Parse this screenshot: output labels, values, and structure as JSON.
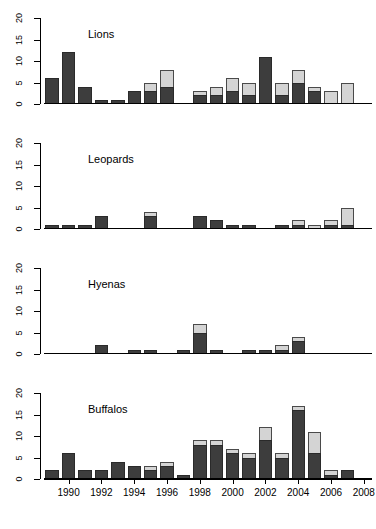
{
  "chart_data": {
    "type": "bar",
    "title": "",
    "stacked": true,
    "panels": [
      {
        "name": "Lions",
        "ylim": [
          0,
          20
        ],
        "yticks": [
          0,
          5,
          10,
          15,
          20
        ],
        "series": [
          {
            "name": "dark",
            "values": [
              6,
              12,
              4,
              1,
              1,
              3,
              3,
              4,
              0,
              2,
              2,
              3,
              2,
              11,
              2,
              5,
              3,
              0,
              0,
              0
            ]
          },
          {
            "name": "light",
            "values": [
              0,
              0,
              0,
              0,
              0,
              0,
              2,
              4,
              0,
              1,
              2,
              3,
              3,
              0,
              3,
              3,
              1,
              3,
              5,
              0
            ]
          }
        ],
        "totals": [
          6,
          12,
          4,
          1,
          1,
          3,
          5,
          8,
          0,
          3,
          4,
          6,
          5,
          11,
          5,
          8,
          4,
          3,
          5,
          0
        ]
      },
      {
        "name": "Leopards",
        "ylim": [
          0,
          20
        ],
        "yticks": [
          0,
          5,
          10,
          15,
          20
        ],
        "series": [
          {
            "name": "dark",
            "values": [
              1,
              1,
              1,
              3,
              0,
              0,
              3,
              0,
              0,
              3,
              2,
              1,
              1,
              0,
              1,
              1,
              0,
              1,
              1,
              0
            ]
          },
          {
            "name": "light",
            "values": [
              0,
              0,
              0,
              0,
              0,
              0,
              1,
              0,
              0,
              0,
              0,
              0,
              0,
              0,
              0,
              1,
              1,
              1,
              4,
              0
            ]
          }
        ],
        "totals": [
          1,
          1,
          1,
          3,
          0,
          0,
          4,
          0,
          0,
          3,
          2,
          1,
          1,
          0,
          1,
          2,
          1,
          2,
          5,
          0
        ]
      },
      {
        "name": "Hyenas",
        "ylim": [
          0,
          20
        ],
        "yticks": [
          0,
          5,
          10,
          15,
          20
        ],
        "series": [
          {
            "name": "dark",
            "values": [
              0,
              0,
              0,
              2,
              0,
              1,
              1,
              0,
              1,
              5,
              1,
              0,
              1,
              1,
              1,
              3,
              0,
              0,
              0,
              0
            ]
          },
          {
            "name": "light",
            "values": [
              0,
              0,
              0,
              0,
              0,
              0,
              0,
              0,
              0,
              2,
              0,
              0,
              0,
              0,
              1,
              1,
              0,
              0,
              0,
              0
            ]
          }
        ],
        "totals": [
          0,
          0,
          0,
          2,
          0,
          1,
          1,
          0,
          1,
          7,
          1,
          0,
          1,
          1,
          2,
          4,
          0,
          0,
          0,
          0
        ]
      },
      {
        "name": "Buffalos",
        "ylim": [
          0,
          20
        ],
        "yticks": [
          0,
          5,
          10,
          15,
          20
        ],
        "series": [
          {
            "name": "dark",
            "values": [
              2,
              6,
              2,
              2,
              4,
              3,
              2,
              3,
              1,
              8,
              8,
              6,
              5,
              9,
              5,
              16,
              6,
              1,
              2,
              0
            ]
          },
          {
            "name": "light",
            "values": [
              0,
              0,
              0,
              0,
              0,
              0,
              1,
              1,
              0,
              1,
              1,
              1,
              1,
              3,
              1,
              1,
              5,
              1,
              0,
              0
            ]
          }
        ],
        "totals": [
          2,
          6,
          2,
          2,
          4,
          3,
          3,
          4,
          1,
          9,
          9,
          7,
          6,
          12,
          6,
          17,
          11,
          2,
          2,
          0
        ]
      }
    ],
    "x": [
      1989,
      1990,
      1991,
      1992,
      1993,
      1994,
      1995,
      1996,
      1997,
      1998,
      1999,
      2000,
      2001,
      2002,
      2003,
      2004,
      2005,
      2006,
      2007,
      2008
    ],
    "xticklabels": [
      "1990",
      "1992",
      "1994",
      "1996",
      "1998",
      "2000",
      "2002",
      "2004",
      "2006",
      "2008"
    ],
    "xticklabel_indices": [
      1,
      3,
      5,
      7,
      9,
      11,
      13,
      15,
      17,
      19
    ],
    "xlabel": "",
    "ylabel": "",
    "grid": false,
    "legend": "none",
    "colors": {
      "dark_series": "#3d3d3d",
      "light_series": "#d4d4d4",
      "axis": "#000000",
      "background": "#ffffff"
    }
  },
  "panel_titles": {
    "p0": "Lions",
    "p1": "Leopards",
    "p2": "Hyenas",
    "p3": "Buffalos"
  }
}
